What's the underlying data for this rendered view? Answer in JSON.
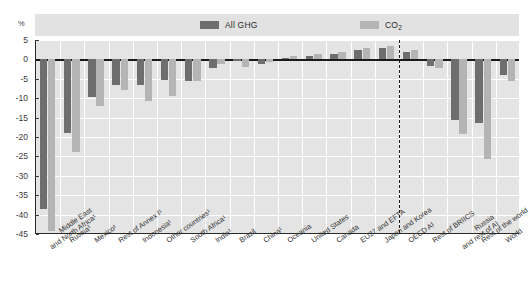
{
  "axis": {
    "unit_label": "%",
    "y_ticks": [
      5,
      0,
      -5,
      -10,
      -15,
      -20,
      -25,
      -30,
      -35,
      -40,
      -45
    ]
  },
  "legend": {
    "ghg_label": "All GHG",
    "co2_label": "CO",
    "co2_sub": "2"
  },
  "chart_data": {
    "type": "bar",
    "title": "",
    "xlabel": "",
    "ylabel": "%",
    "ylim": [
      -45,
      5
    ],
    "grid": true,
    "legend_position": "top",
    "categories": [
      "Middle East and North Africa¹",
      "Russia¹",
      "Mexico¹",
      "Rest of Annex I¹",
      "Indonesia¹",
      "Other countries¹",
      "South Africa¹",
      "India¹",
      "Brazil",
      "China¹",
      "Oceania",
      "United States",
      "Canada",
      "EU27 and EFTA",
      "Japan and Korea",
      "OECD AI",
      "Rest of BRIICS",
      "Russia and rest of AI",
      "Rest of the world",
      "World"
    ],
    "category_lines": [
      [
        "Middle East",
        "and North Africa¹"
      ],
      [
        "Russia¹"
      ],
      [
        "Mexico¹"
      ],
      [
        "Rest of Annex I¹"
      ],
      [
        "Indonesia¹"
      ],
      [
        "Other countries¹"
      ],
      [
        "South Africa¹"
      ],
      [
        "India¹"
      ],
      [
        "Brazil"
      ],
      [
        "China¹"
      ],
      [
        "Oceania"
      ],
      [
        "United States"
      ],
      [
        "Canada"
      ],
      [
        "EU27 and EFTA"
      ],
      [
        "Japan and Korea"
      ],
      [
        "OECD AI"
      ],
      [
        "Rest of BRIICS"
      ],
      [
        "Russia",
        "and rest of AI"
      ],
      [
        "Rest of the world"
      ],
      [
        "World"
      ]
    ],
    "series": [
      {
        "name": "All GHG",
        "color": "#6e6e6e",
        "values": [
          -38.5,
          -19.0,
          -9.8,
          -6.5,
          -6.7,
          -5.2,
          -5.6,
          -2.1,
          -0.4,
          -1.2,
          0.4,
          0.9,
          1.3,
          2.3,
          2.9,
          1.8,
          -1.6,
          -15.6,
          -16.5,
          -3.9
        ]
      },
      {
        "name": "CO2",
        "color": "#b4b4b4",
        "values": [
          -44.2,
          -23.8,
          -12.1,
          -8.0,
          -10.6,
          -9.4,
          -5.5,
          -1.1,
          -2.0,
          -0.6,
          1.0,
          1.5,
          1.8,
          2.9,
          3.4,
          2.5,
          -2.3,
          -19.2,
          -25.6,
          -5.6
        ]
      }
    ],
    "separator_after_category_index": 14
  }
}
